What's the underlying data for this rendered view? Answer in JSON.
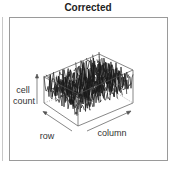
{
  "title": "Corrected",
  "axes": {
    "z_label_line1": "cell",
    "z_label_line2": "count",
    "x_label": "row",
    "y_label": "column"
  },
  "colors": {
    "surface": "#1a1a1a",
    "box": "#555555",
    "frame": "#9a9a9a"
  }
}
